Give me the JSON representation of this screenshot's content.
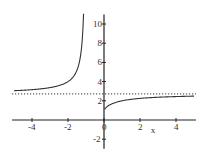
{
  "chart_data": {
    "type": "line",
    "title": "",
    "xlabel": "x",
    "ylabel": "",
    "xlim": [
      -5,
      5
    ],
    "ylim": [
      -3,
      11
    ],
    "grid": false,
    "x_ticks": [
      -4,
      -2,
      0,
      2,
      4
    ],
    "y_ticks": [
      -2,
      2,
      4,
      6,
      8,
      10
    ],
    "x_tick_labels": [
      "-4",
      "-2",
      "0",
      "2",
      "4"
    ],
    "y_tick_labels": [
      "-2",
      "2",
      "4",
      "6",
      "8",
      "10"
    ],
    "series": [
      {
        "name": "f(x) = (1+1/x)^x, x < -1",
        "style": "solid",
        "x": [
          -5,
          -4,
          -3,
          -2.5,
          -2,
          -1.5,
          -1.3,
          -1.2,
          -1.15,
          -1.1
        ],
        "y": [
          3.05,
          3.16,
          3.38,
          3.57,
          4.0,
          5.2,
          6.72,
          8.59,
          10.35,
          11.0
        ]
      },
      {
        "name": "f(x) = (1+1/x)^x, x > 0",
        "style": "solid",
        "x": [
          0.05,
          0.2,
          0.5,
          1,
          2,
          3,
          4,
          5
        ],
        "y": [
          1.16,
          1.43,
          1.73,
          2.0,
          2.25,
          2.37,
          2.44,
          2.49
        ]
      },
      {
        "name": "asymptote y = e",
        "style": "dotted",
        "x": [
          -5,
          5
        ],
        "y": [
          2.718,
          2.718
        ]
      }
    ]
  },
  "axes": {
    "x_label": "x"
  }
}
